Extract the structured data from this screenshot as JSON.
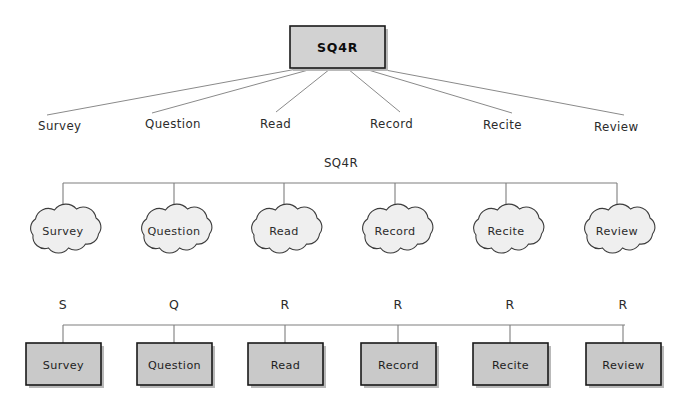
{
  "steps": [
    "Survey",
    "Question",
    "Read",
    "Record",
    "Recite",
    "Review"
  ],
  "initials": [
    "S",
    "Q",
    "R",
    "R",
    "R",
    "R"
  ],
  "top_section": {
    "root_label": "SQ4R",
    "labels": [
      "Survey",
      "Question",
      "Read",
      "Record",
      "Recite",
      "Review"
    ]
  },
  "middle_section": {
    "title": "SQ4R",
    "clouds": [
      "Survey",
      "Question",
      "Read",
      "Record",
      "Recite",
      "Review"
    ]
  },
  "bottom_section": {
    "letters": [
      "S",
      "Q",
      "R",
      "R",
      "R",
      "R"
    ],
    "boxes": [
      "Survey",
      "Question",
      "Read",
      "Record",
      "Recite",
      "Review"
    ]
  },
  "colors": {
    "background": "#ffffff",
    "root_box_fill": "#d2d2d2",
    "root_box_stroke": "#1a1a1a",
    "cloud_fill": "#efefef",
    "cloud_stroke": "#3c3c3c",
    "process_box_fill": "#c9c9c9",
    "process_box_stroke": "#1a1a1a",
    "connector_line": "#7a7a7a",
    "text": "#2b2b2b"
  }
}
